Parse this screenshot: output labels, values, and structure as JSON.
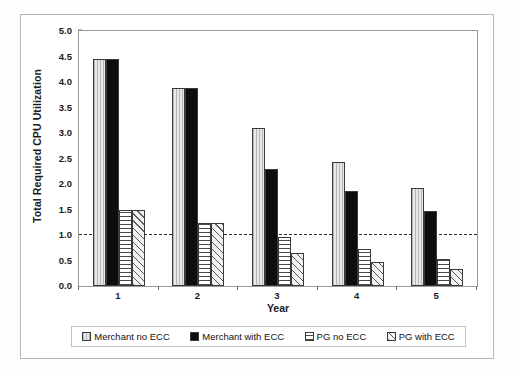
{
  "chart_data": {
    "type": "bar",
    "title": "",
    "subtitle": "",
    "xlabel": "Year",
    "ylabel": "Total Required CPU Utilization",
    "categories": [
      "1",
      "2",
      "3",
      "4",
      "5"
    ],
    "ylim": [
      0.0,
      5.0
    ],
    "ytick_step": 0.5,
    "yticks": [
      "0.0",
      "0.5",
      "1.0",
      "1.5",
      "2.0",
      "2.5",
      "3.0",
      "3.5",
      "4.0",
      "4.5",
      "5.0"
    ],
    "grid": false,
    "legend_position": "bottom",
    "annotations": [
      {
        "name": "threshold-line",
        "type": "horizontal-dashed-line",
        "value": 1.0,
        "label": ""
      }
    ],
    "series": [
      {
        "name": "Merchant no ECC",
        "pattern": "vertical-lines",
        "color": "#d2d2d2",
        "values": [
          4.45,
          3.88,
          3.1,
          2.43,
          1.93
        ]
      },
      {
        "name": "Merchant with ECC",
        "pattern": "solid-black",
        "color": "#0d0d0d",
        "values": [
          4.45,
          3.88,
          2.3,
          1.87,
          1.47
        ]
      },
      {
        "name": "PG no ECC",
        "pattern": "horizontal-lines",
        "color": "#ffffff",
        "values": [
          1.5,
          1.23,
          0.97,
          0.72,
          0.52
        ]
      },
      {
        "name": "PG with ECC",
        "pattern": "diagonal-hatch",
        "color": "#efefef",
        "values": [
          1.5,
          1.23,
          0.65,
          0.48,
          0.33
        ]
      }
    ]
  },
  "legend": {
    "items": [
      {
        "label": "Merchant no ECC",
        "pattern": "vertical-lines"
      },
      {
        "label": "Merchant with ECC",
        "pattern": "solid-black"
      },
      {
        "label": "PG no ECC",
        "pattern": "horizontal-lines"
      },
      {
        "label": "PG with ECC",
        "pattern": "diagonal-hatch"
      }
    ]
  }
}
